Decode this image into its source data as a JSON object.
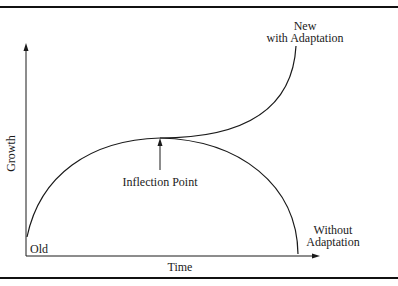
{
  "diagram": {
    "type": "growth-curve",
    "axes": {
      "x_label": "Time",
      "y_label": "Growth"
    },
    "labels": {
      "origin": "Old",
      "new_line1": "New",
      "new_line2": "with Adaptation",
      "inflection": "Inflection Point",
      "without_line1": "Without",
      "without_line2": "Adaptation"
    },
    "colors": {
      "line": "#1a1a1a",
      "background": "#ffffff"
    }
  }
}
